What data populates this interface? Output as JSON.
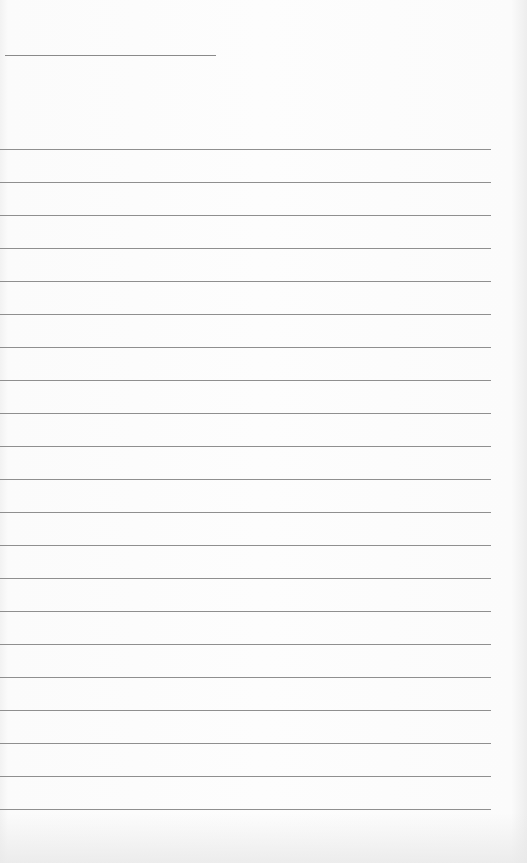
{
  "page": {
    "type": "blank lined paper",
    "header_line": {
      "x": 5,
      "y": 55,
      "width": 211
    },
    "ruled_lines": {
      "count": 21,
      "first_y": 149,
      "spacing": 33,
      "width": 491
    },
    "colors": {
      "paper": "#fcfcfc",
      "line": "#8f8f8f"
    }
  }
}
